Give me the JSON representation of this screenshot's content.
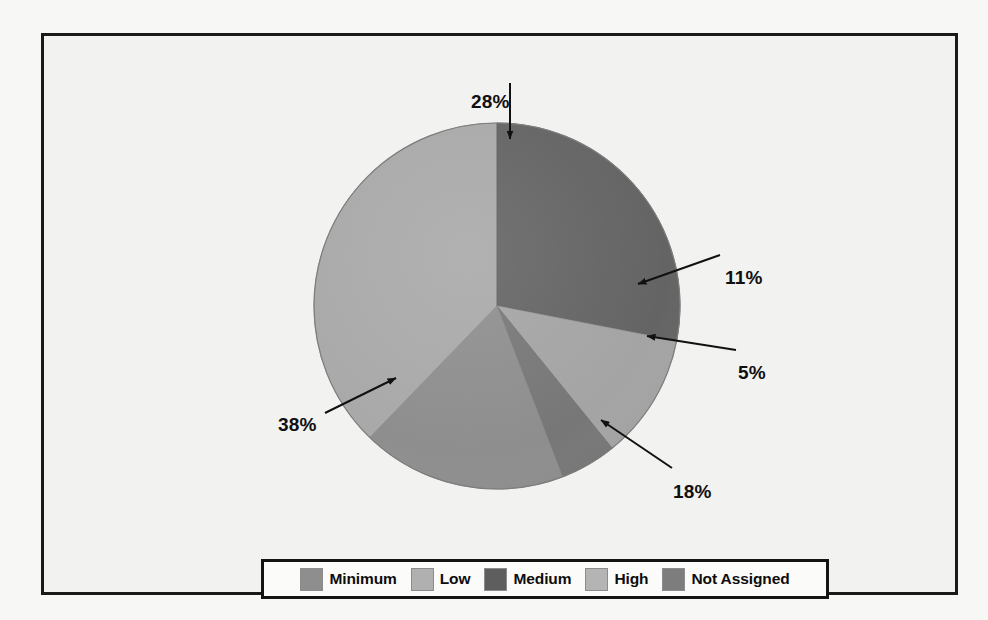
{
  "chart_data": {
    "type": "pie",
    "title": "",
    "subtitle": "",
    "xlabel": "",
    "ylabel": "",
    "grid": false,
    "legend_position": "bottom",
    "categories": [
      "Minimum",
      "Low",
      "Medium",
      "High",
      "Not Assigned"
    ],
    "values": [
      18,
      11,
      28,
      38,
      5
    ],
    "value_unit": "%",
    "slices": [
      {
        "label": "Minimum",
        "value": 18,
        "display": "18%",
        "color": "#8e8e8e",
        "start_angle": 159,
        "end_angle": 224
      },
      {
        "label": "Low",
        "value": 11,
        "display": "11%",
        "color": "#a4a4a4",
        "start_angle": 101,
        "end_angle": 141
      },
      {
        "label": "Medium",
        "value": 28,
        "display": "28%",
        "color": "#646464",
        "start_angle": 0,
        "end_angle": 101
      },
      {
        "label": "High",
        "value": 38,
        "display": "38%",
        "color": "#a9a9a9",
        "start_angle": 224,
        "end_angle": 360
      },
      {
        "label": "Not Assigned",
        "value": 5,
        "display": "5%",
        "color": "#777777",
        "start_angle": 141,
        "end_angle": 159
      }
    ],
    "annotations": [
      {
        "text": "28%",
        "points_to": "Medium"
      },
      {
        "text": "11%",
        "points_to": "Low"
      },
      {
        "text": "5%",
        "points_to": "Not Assigned"
      },
      {
        "text": "18%",
        "points_to": "Minimum"
      },
      {
        "text": "38%",
        "points_to": "High"
      }
    ]
  },
  "labels": {
    "medium": "28%",
    "low": "11%",
    "not_assigned": "5%",
    "minimum": "18%",
    "high": "38%"
  },
  "legend": {
    "items": [
      {
        "label": "Minimum",
        "color": "#8e8e8e"
      },
      {
        "label": "Low",
        "color": "#b0b0b0"
      },
      {
        "label": "Medium",
        "color": "#5e5e5e"
      },
      {
        "label": "High",
        "color": "#b4b4b4"
      },
      {
        "label": "Not Assigned",
        "color": "#7d7d7d"
      }
    ]
  },
  "colors": {
    "frame_border": "#1a1a1a",
    "background": "#f2f2f0",
    "page": "#f7f7f5",
    "label_text": "#101010",
    "arrow": "#111111"
  }
}
